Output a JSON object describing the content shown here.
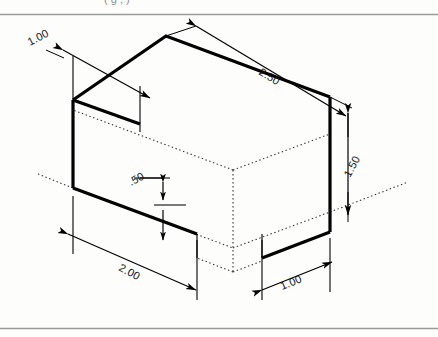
{
  "page": {
    "background_color": "#fdfdfc",
    "line_color": "#000000",
    "rule_color": "#9a9a9a",
    "caption_fragment": "(  g     ,  )"
  },
  "figure": {
    "type": "isometric-technical-drawing",
    "object_lines": {
      "visible_color": "#000000",
      "hidden_style": "dotted",
      "heavy_stroke_width": 3.2,
      "light_stroke_width": 1.1
    }
  },
  "dimensions": [
    {
      "id": "depth-top-left",
      "label": "1.00",
      "orientation": "iso-left",
      "rotation_deg": -28,
      "text_x": 30,
      "text_y": 46,
      "arrows": "both",
      "describes": "notch depth at upper left"
    },
    {
      "id": "length-top-right",
      "label": "2.50",
      "orientation": "iso-right",
      "rotation_deg": 31,
      "text_x": 262,
      "text_y": 70,
      "arrows": "both",
      "describes": "overall length along top right edge"
    },
    {
      "id": "height-right",
      "label": "1.50",
      "orientation": "vertical",
      "rotation_deg": -62,
      "text_x": 356,
      "text_y": 172,
      "arrows": "both",
      "describes": "overall height at right face"
    },
    {
      "id": "notch-height",
      "label": ".50",
      "orientation": "vertical",
      "rotation_deg": -28,
      "text_x": 136,
      "text_y": 184,
      "arrows": "both",
      "describes": "notch height on front face"
    },
    {
      "id": "width-bottom-left",
      "label": "2.00",
      "orientation": "iso-left",
      "rotation_deg": 28,
      "text_x": 124,
      "text_y": 266,
      "arrows": "both",
      "describes": "front face width along bottom left"
    },
    {
      "id": "width-bottom-right",
      "label": "1.00",
      "orientation": "iso-right",
      "rotation_deg": -28,
      "text_x": 287,
      "text_y": 287,
      "arrows": "both",
      "describes": "right face width along bottom right"
    }
  ]
}
